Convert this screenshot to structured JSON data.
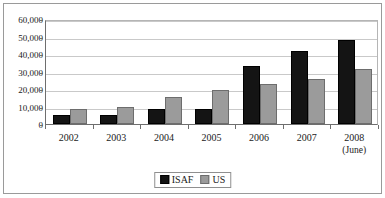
{
  "chart_data": {
    "type": "bar",
    "title": "",
    "subtitle": "",
    "xlabel": "",
    "ylabel": "",
    "categories": [
      "2002",
      "2003",
      "2004",
      "2005",
      "2006",
      "2007",
      "2008"
    ],
    "category_sublabels": [
      "",
      "",
      "",
      "",
      "",
      "",
      "(June)"
    ],
    "series": [
      {
        "name": "ISAF",
        "color": "#141414",
        "values": [
          5000,
          5300,
          8300,
          8700,
          33000,
          41500,
          48000
        ]
      },
      {
        "name": "US",
        "color": "#9b9b9b",
        "values": [
          8700,
          9600,
          15700,
          19500,
          22700,
          25600,
          31500
        ]
      }
    ],
    "ylim": [
      0,
      60000
    ],
    "ytick_values": [
      60000,
      50000,
      40000,
      30000,
      20000,
      10000,
      0
    ],
    "ytick_labels": [
      "60,000",
      "50,000",
      "40,000",
      "30,000",
      "20,000",
      "10,000",
      "0"
    ],
    "grid": true,
    "grid_axis": "y",
    "legend": {
      "position": "bottom-center",
      "entries": [
        {
          "label": "ISAF",
          "color": "#141414"
        },
        {
          "label": "US",
          "color": "#9b9b9b"
        }
      ]
    },
    "colors": {
      "isaf": "#141414",
      "us": "#9b9b9b",
      "gridline": "#c9c9c9",
      "axis": "#6e6e6e",
      "frame": "#9a9a9a",
      "background": "#ffffff",
      "text": "#1a1a1a"
    }
  }
}
